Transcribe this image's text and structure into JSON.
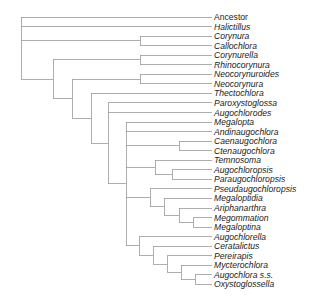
{
  "figure": {
    "type": "cladogram",
    "line_color": "#9a9a9a",
    "text_color": "#222222",
    "label_x": 214,
    "tip_x": 212,
    "first_tip_y": 17,
    "tip_spacing": 9.55
  },
  "taxa": [
    {
      "name": "Ancestor",
      "italic": false
    },
    {
      "name": "Halictillus",
      "italic": true
    },
    {
      "name": "Corynura",
      "italic": true
    },
    {
      "name": "Callochlora",
      "italic": true
    },
    {
      "name": "Corynurella",
      "italic": true
    },
    {
      "name": "Rhinocorynura",
      "italic": true
    },
    {
      "name": "Neocorynuroides",
      "italic": true
    },
    {
      "name": "Neocorynura",
      "italic": true
    },
    {
      "name": "Thectochlora",
      "italic": true
    },
    {
      "name": "Paroxystoglossa",
      "italic": true
    },
    {
      "name": "Augochlorodes",
      "italic": true
    },
    {
      "name": "Megalopta",
      "italic": true
    },
    {
      "name": "Andinaugochlora",
      "italic": true
    },
    {
      "name": "Caenaugochlora",
      "italic": true
    },
    {
      "name": "Ctenaugochlora",
      "italic": true
    },
    {
      "name": "Temnosoma",
      "italic": true
    },
    {
      "name": "Augochloropsis",
      "italic": true
    },
    {
      "name": "Paraugochloropsis",
      "italic": true
    },
    {
      "name": "Pseudaugochloropsis",
      "italic": true
    },
    {
      "name": "Megaloptidia",
      "italic": true
    },
    {
      "name": "Ariphanarthra",
      "italic": true
    },
    {
      "name": "Megommation",
      "italic": true
    },
    {
      "name": "Megaloptina",
      "italic": true
    },
    {
      "name": "Augochlorella",
      "italic": true
    },
    {
      "name": "Ceratalictus",
      "italic": true
    },
    {
      "name": "Pereirapis",
      "italic": true
    },
    {
      "name": "Mycterochlora",
      "italic": true
    },
    {
      "name": "Augochlora s.s.",
      "italic": true
    },
    {
      "name": "Oxystoglossella",
      "italic": true
    }
  ],
  "tree": {
    "x": 21,
    "children": [
      {
        "tip": 0
      },
      {
        "tip": 1
      },
      {
        "x": 140,
        "children": [
          {
            "tip": 2
          },
          {
            "tip": 3
          }
        ]
      },
      {
        "x": 53,
        "children": [
          {
            "x": 140,
            "children": [
              {
                "tip": 4
              },
              {
                "tip": 5
              }
            ]
          },
          {
            "x": 72,
            "children": [
              {
                "x": 140,
                "children": [
                  {
                    "tip": 6
                  },
                  {
                    "tip": 7
                  }
                ]
              },
              {
                "x": 91,
                "children": [
                  {
                    "tip": 8
                  },
                  {
                    "x": 108,
                    "children": [
                      {
                        "tip": 9
                      },
                      {
                        "tip": 10
                      },
                      {
                        "x": 126,
                        "children": [
                          {
                            "tip": 11
                          },
                          {
                            "tip": 12
                          },
                          {
                            "x": 179,
                            "children": [
                              {
                                "tip": 13
                              },
                              {
                                "tip": 14
                              }
                            ]
                          },
                          {
                            "x": 155,
                            "children": [
                              {
                                "tip": 15
                              },
                              {
                                "x": 172,
                                "children": [
                                  {
                                    "tip": 16
                                  },
                                  {
                                    "tip": 17
                                  }
                                ]
                              }
                            ]
                          },
                          {
                            "x": 150,
                            "children": [
                              {
                                "tip": 18
                              },
                              {
                                "x": 164,
                                "children": [
                                  {
                                    "tip": 19
                                  },
                                  {
                                    "x": 179,
                                    "children": [
                                      {
                                        "tip": 20
                                      },
                                      {
                                        "x": 193,
                                        "children": [
                                          {
                                            "tip": 21
                                          },
                                          {
                                            "tip": 22
                                          }
                                        ]
                                      }
                                    ]
                                  }
                                ]
                              }
                            ]
                          },
                          {
                            "x": 139,
                            "children": [
                              {
                                "tip": 23
                              },
                              {
                                "x": 153,
                                "children": [
                                  {
                                    "tip": 24
                                  },
                                  {
                                    "x": 167,
                                    "children": [
                                      {
                                        "tip": 25
                                      },
                                      {
                                        "x": 181,
                                        "children": [
                                          {
                                            "tip": 26
                                          },
                                          {
                                            "x": 195,
                                            "children": [
                                              {
                                                "tip": 27
                                              },
                                              {
                                                "tip": 28
                                              }
                                            ]
                                          }
                                        ]
                                      }
                                    ]
                                  }
                                ]
                              }
                            ]
                          }
                        ]
                      }
                    ]
                  }
                ]
              }
            ]
          }
        ]
      }
    ]
  }
}
